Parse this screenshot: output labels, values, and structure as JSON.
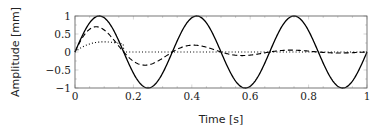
{
  "chart_data": {
    "type": "line",
    "title": "",
    "xlabel": "Time [s]",
    "ylabel": "Amplitude [mm]",
    "xlim": [
      0,
      1
    ],
    "ylim": [
      -1,
      1
    ],
    "xticks": [
      0,
      0.2,
      0.4,
      0.6,
      0.8,
      1
    ],
    "xtick_labels": [
      "0",
      "0.2",
      "0.4",
      "0.6",
      "0.8",
      "1"
    ],
    "yticks": [
      1,
      0.5,
      0,
      -0.5,
      -1
    ],
    "ytick_labels": [
      "1",
      "0.5",
      "0",
      "−0.5",
      "−1"
    ],
    "grid": false,
    "legend": null,
    "series": [
      {
        "name": "solid",
        "style": "solid",
        "color": "#000000",
        "description": "sin(2π·3t), amplitude 1, period 1/3 s",
        "x": [
          0,
          0.083,
          0.167,
          0.25,
          0.333,
          0.417,
          0.5,
          0.583,
          0.667,
          0.75,
          0.833,
          0.917,
          1.0
        ],
        "y": [
          0,
          1,
          0,
          -1,
          0,
          1,
          0,
          -1,
          0,
          1,
          0,
          -1,
          0
        ]
      },
      {
        "name": "dashed",
        "style": "dashed",
        "color": "#000000",
        "description": "damped sine, same frequency",
        "x": [
          0,
          0.083,
          0.167,
          0.25,
          0.333,
          0.417,
          0.5,
          0.583,
          0.667,
          0.75,
          0.833,
          0.917,
          1.0
        ],
        "y": [
          0,
          0.75,
          0,
          -0.4,
          0,
          0.2,
          0,
          -0.07,
          0,
          0.04,
          0,
          -0.02,
          0
        ]
      },
      {
        "name": "dotted",
        "style": "dotted",
        "color": "#000000",
        "description": "short pulse decaying to zero",
        "x": [
          0,
          0.05,
          0.1,
          0.167,
          0.2,
          1.0
        ],
        "y": [
          0,
          0.3,
          0.2,
          0,
          0,
          0
        ]
      }
    ],
    "plot_area_px": {
      "left": 75,
      "top": 16,
      "right": 367,
      "bottom": 88
    }
  }
}
